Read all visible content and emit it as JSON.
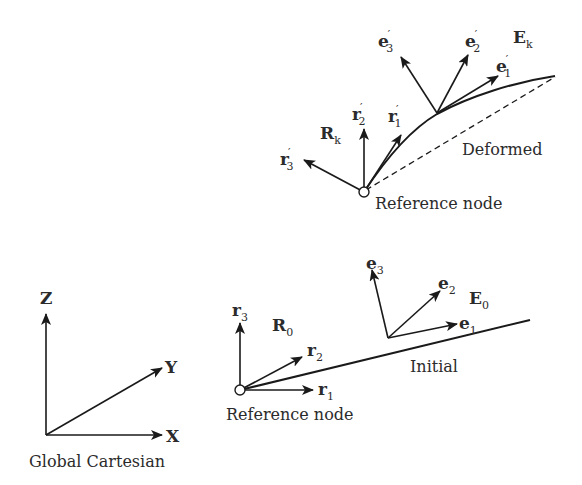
{
  "diagram": {
    "global_frame": {
      "caption": "Global Cartesian",
      "axes": {
        "x": "X",
        "y": "Y",
        "z": "Z"
      }
    },
    "initial": {
      "caption": "Initial",
      "node_caption": "Reference node",
      "reference_frame": {
        "name": "R",
        "sub": "0",
        "vectors": [
          {
            "base": "r",
            "sub": "1",
            "prime": ""
          },
          {
            "base": "r",
            "sub": "2",
            "prime": ""
          },
          {
            "base": "r",
            "sub": "3",
            "prime": ""
          }
        ]
      },
      "element_frame": {
        "name": "E",
        "sub": "0",
        "vectors": [
          {
            "base": "e",
            "sub": "1",
            "prime": ""
          },
          {
            "base": "e",
            "sub": "2",
            "prime": ""
          },
          {
            "base": "e",
            "sub": "3",
            "prime": ""
          }
        ]
      }
    },
    "deformed": {
      "caption": "Deformed",
      "node_caption": "Reference node",
      "reference_frame": {
        "name": "R",
        "sub": "k",
        "vectors": [
          {
            "base": "r",
            "sub": "1",
            "prime": "′"
          },
          {
            "base": "r",
            "sub": "2",
            "prime": "′"
          },
          {
            "base": "r",
            "sub": "3",
            "prime": "′"
          }
        ]
      },
      "element_frame": {
        "name": "E",
        "sub": "k",
        "vectors": [
          {
            "base": "e",
            "sub": "1",
            "prime": "′"
          },
          {
            "base": "e",
            "sub": "2",
            "prime": "′"
          },
          {
            "base": "e",
            "sub": "3",
            "prime": "′"
          }
        ]
      }
    },
    "colors": {
      "stroke": "#1a1a1a",
      "text": "#2b2b2b",
      "background": "#ffffff"
    }
  }
}
